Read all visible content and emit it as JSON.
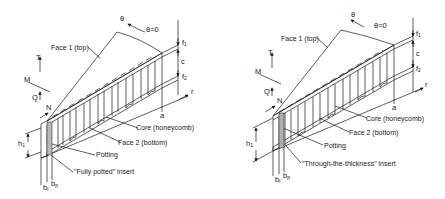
{
  "diagrams": [
    {
      "id": "left",
      "insert_type": "\"Fully potted\" insert",
      "labels": {
        "face1": "Face 1 (top)",
        "face2": "Face 2 (bottom)",
        "core": "Core (honeycomb)",
        "potting": "Potting",
        "theta": "θ",
        "theta0": "θ=0",
        "t": "T",
        "m": "M",
        "q": "Q",
        "n": "N",
        "f1": "f",
        "f1_sub": "1",
        "c": "c",
        "f2": "f",
        "f2_sub": "2",
        "r": "r",
        "a": "a",
        "h1": "h",
        "h1_sub": "1",
        "bi": "b",
        "bi_sub": "i",
        "bp": "b",
        "bp_sub": "p"
      }
    },
    {
      "id": "right",
      "insert_type": "\"Through-the-thickness\" insert",
      "labels": {
        "face1": "Face 1 (top)",
        "face2": "Face 2 (bottom)",
        "core": "Core (honeycomb)",
        "potting": "Potting",
        "theta": "θ",
        "theta0": "θ=0",
        "t": "T",
        "m": "M",
        "q": "Q",
        "n": "N",
        "f1": "f",
        "f1_sub": "1",
        "c": "c",
        "f2": "f",
        "f2_sub": "2",
        "r": "r",
        "a": "a",
        "h1": "h",
        "h1_sub": "1",
        "bi": "b",
        "bi_sub": "i",
        "bp": "b",
        "bp_sub": "p"
      }
    }
  ],
  "colors": {
    "line": "#1a1a1a",
    "potting_fill": "#bdbdbd",
    "background": "#ffffff"
  }
}
